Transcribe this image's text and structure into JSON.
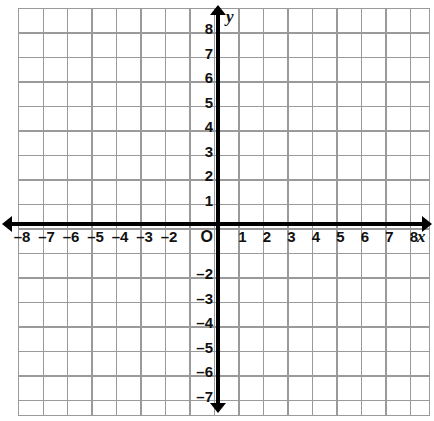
{
  "figure": {
    "type": "coordinate-plane",
    "title": "",
    "background_color": "#ffffff",
    "grid_color": "#9a9a9a",
    "axis_color": "#000000",
    "label_color": "#111111"
  },
  "axes": {
    "x": {
      "name": "x",
      "arrow_start": true,
      "arrow_end": true,
      "min": -8,
      "max": 8,
      "tick_interval": 1,
      "labels": [
        "–8",
        "–7",
        "–6",
        "–5",
        "–4",
        "–3",
        "–2",
        "1",
        "2",
        "3",
        "4",
        "5",
        "6",
        "7",
        "8"
      ],
      "label_values": [
        -8,
        -7,
        -6,
        -5,
        -4,
        -3,
        -2,
        1,
        2,
        3,
        4,
        5,
        6,
        7,
        8
      ]
    },
    "y": {
      "name": "y",
      "arrow_start": true,
      "arrow_end": true,
      "min": -7,
      "max": 8,
      "tick_interval": 1,
      "labels": [
        "8",
        "7",
        "6",
        "5",
        "4",
        "3",
        "2",
        "1",
        "–2",
        "–3",
        "–4",
        "–5",
        "–6",
        "–7"
      ],
      "label_values": [
        8,
        7,
        6,
        5,
        4,
        3,
        2,
        1,
        -2,
        -3,
        -4,
        -5,
        -6,
        -7
      ]
    }
  },
  "origin": {
    "label": "O"
  },
  "chart_data": {
    "type": "scatter",
    "title": "",
    "xlabel": "x",
    "ylabel": "y",
    "xlim": [
      -8,
      8
    ],
    "ylim": [
      -7,
      8
    ],
    "xticks": [
      -8,
      -7,
      -6,
      -5,
      -4,
      -3,
      -2,
      1,
      2,
      3,
      4,
      5,
      6,
      7,
      8
    ],
    "xticklabels": [
      "–8",
      "–7",
      "–6",
      "–5",
      "–4",
      "–3",
      "–2",
      "1",
      "2",
      "3",
      "4",
      "5",
      "6",
      "7",
      "8"
    ],
    "yticks": [
      8,
      7,
      6,
      5,
      4,
      3,
      2,
      1,
      -2,
      -3,
      -4,
      -5,
      -6,
      -7
    ],
    "yticklabels": [
      "8",
      "7",
      "6",
      "5",
      "4",
      "3",
      "2",
      "1",
      "–2",
      "–3",
      "–4",
      "–5",
      "–6",
      "–7"
    ],
    "grid": true,
    "legend": null,
    "series": [],
    "points": [],
    "annotations": [
      "O"
    ]
  }
}
